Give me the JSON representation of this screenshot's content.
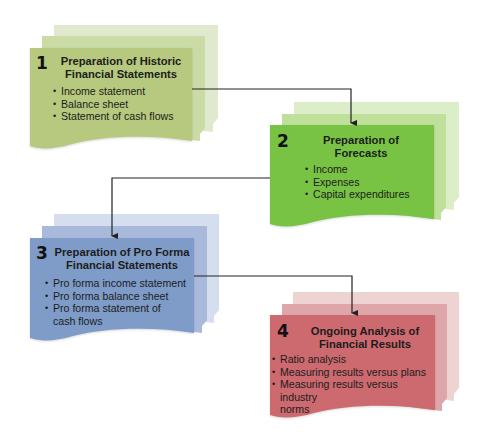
{
  "diagram": {
    "type": "process-flow",
    "steps": [
      {
        "number": "1",
        "title_line1": "Preparation of Historic",
        "title_line2": "Financial Statements",
        "bullets": [
          "Income statement",
          "Balance sheet",
          "Statement of cash flows"
        ],
        "colors": {
          "front": "#b6c97e",
          "middle": "#cbdba5",
          "back": "#e0e9cd"
        }
      },
      {
        "number": "2",
        "title_line1": "Preparation of",
        "title_line2": "Forecasts",
        "bullets": [
          "Income",
          "Expenses",
          "Capital expenditures"
        ],
        "colors": {
          "front": "#78c344",
          "middle": "#bfe09a",
          "back": "#dbeec8"
        }
      },
      {
        "number": "3",
        "title_line1": "Preparation of Pro Forma",
        "title_line2": "Financial Statements",
        "bullets": [
          "Pro forma income statement",
          "Pro forma balance sheet",
          "Pro forma statement of",
          "cash flows"
        ],
        "colors": {
          "front": "#7f9cc9",
          "middle": "#a9b9dc",
          "back": "#d5deef"
        }
      },
      {
        "number": "4",
        "title_line1": "Ongoing Analysis of",
        "title_line2": "Financial Results",
        "bullets": [
          "Ratio analysis",
          "Measuring results versus plans",
          "Measuring results versus industry",
          "norms"
        ],
        "colors": {
          "front": "#cc6a6f",
          "middle": "#dea6a8",
          "back": "#eed3d3"
        }
      }
    ],
    "connectors": [
      {
        "from": "1",
        "to": "2"
      },
      {
        "from": "2",
        "to": "3"
      },
      {
        "from": "3",
        "to": "4"
      }
    ],
    "line_color": "#222222"
  }
}
